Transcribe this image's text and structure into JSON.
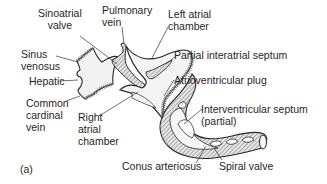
{
  "figure": {
    "panel_label": "(a)",
    "colors": {
      "outline": "#2a2a2a",
      "hatch": "#7a7a7a",
      "chamber_fill": "#eeeeee",
      "background": "#ffffff"
    }
  },
  "labels": {
    "sinoatrial_valve": {
      "line1": "Sinoatrial",
      "line2": "valve"
    },
    "pulmonary_vein": {
      "line1": "Pulmonary",
      "line2": "vein"
    },
    "left_atrial_chamber": {
      "line1": "Left atrial",
      "line2": "chamber"
    },
    "sinus_venosus": {
      "line1": "Sinus",
      "line2": "venosus"
    },
    "partial_interatrial_septum": "Partial interatrial septum",
    "hepatic": "Hepatic",
    "atrioventricular_plug": "Atrioventricular plug",
    "common_cardinal_vein": {
      "line1": "Common",
      "line2": "cardinal",
      "line3": "vein"
    },
    "right_atrial_chamber": {
      "line1": "Right",
      "line2": "atrial",
      "line3": "chamber"
    },
    "interventricular_septum": {
      "line1": "Interventricular septum",
      "line2": "(partial)"
    },
    "conus_arteriosus": "Conus arteriosus",
    "spiral_valve": "Spiral valve"
  }
}
